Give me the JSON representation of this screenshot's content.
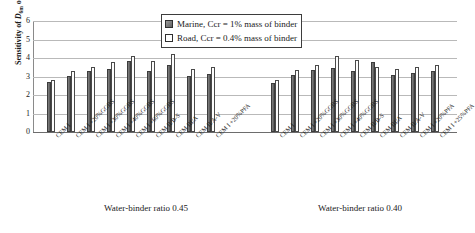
{
  "chart_data": {
    "type": "bar",
    "title": "",
    "xlabel": "",
    "ylabel": "Sensitivity of D6m or D",
    "ylim": [
      0,
      6
    ],
    "yticks": [
      0,
      1,
      2,
      3,
      4,
      5,
      6
    ],
    "grid": true,
    "legend_position": "top-center",
    "series": [
      {
        "name": "Marine, Ccr = 1% mass of binder",
        "key": "marine",
        "color": "#6f6f6f",
        "swatch": "filled-dark-gray-square"
      },
      {
        "name": "Road, Ccr = 0.4% mass of binder",
        "key": "road",
        "color": "#ffffff",
        "swatch": "open-white-square"
      }
    ],
    "groups": [
      {
        "caption": "Water-binder ratio 0.45",
        "categories": [
          "CEM I",
          "CEM I +20%GGBS",
          "CEM I +30%GGBS",
          "CEM I +40%GGBS",
          "CEM I +60%GGBS",
          "CEM II/B-S",
          "CEM III/A",
          "CEM II/A-V",
          "CEM I +20%PFA"
        ],
        "marine": [
          2.7,
          3.05,
          3.3,
          3.4,
          3.85,
          3.3,
          3.6,
          3.05,
          3.15
        ],
        "road": [
          2.8,
          3.3,
          3.5,
          3.8,
          4.1,
          3.85,
          4.2,
          3.4,
          3.5
        ]
      },
      {
        "caption": "Water-binder ratio 0.40",
        "categories": [
          "CEM I",
          "CEM I +20%GGBS",
          "CEM I +30%GGBS",
          "CEM I +40%GGBS",
          "CEM II/B-S",
          "CEM III/A",
          "CEM II/A-V",
          "CEM I +20%PFA",
          "CEM I +25%PFA"
        ],
        "marine": [
          2.65,
          3.1,
          3.35,
          3.45,
          3.3,
          3.8,
          3.1,
          3.2,
          3.3
        ],
        "road": [
          2.8,
          3.35,
          3.6,
          4.1,
          3.9,
          3.5,
          3.4,
          3.5,
          3.6
        ]
      }
    ]
  },
  "axis": {
    "ylabel_main": "Sensitivity of ",
    "ylabel_sym1": "D",
    "ylabel_sub1": "6m",
    "ylabel_mid": " or ",
    "ylabel_sym2": "D"
  }
}
